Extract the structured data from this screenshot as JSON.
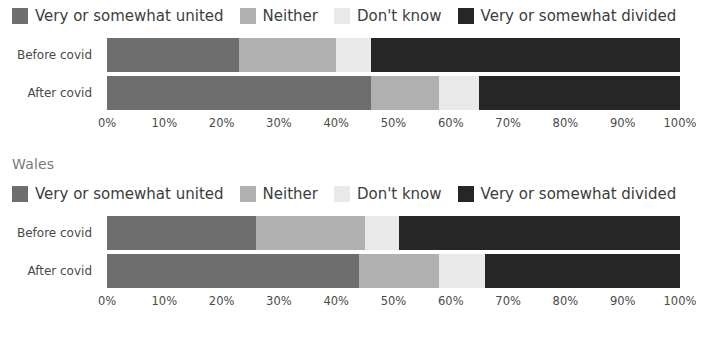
{
  "palette": {
    "united": "#6e6e6e",
    "neither": "#b0b0b0",
    "dont_know": "#e9e9e9",
    "divided": "#262626",
    "text": "#3d3d3d",
    "title_text": "#7a7a7a",
    "background": "#ffffff"
  },
  "legend": {
    "items": [
      {
        "label": "Very or somewhat united",
        "color": "#6e6e6e",
        "key": "united"
      },
      {
        "label": "Neither",
        "color": "#b0b0b0",
        "key": "neither"
      },
      {
        "label": "Don't know",
        "color": "#e9e9e9",
        "key": "dont_know"
      },
      {
        "label": "Very or somewhat divided",
        "color": "#262626",
        "key": "divided"
      }
    ]
  },
  "axis": {
    "ticks": [
      "0%",
      "10%",
      "20%",
      "30%",
      "40%",
      "50%",
      "60%",
      "70%",
      "80%",
      "90%",
      "100%"
    ],
    "min": 0,
    "max": 100
  },
  "sections": [
    {
      "id": "chart-top",
      "title": "",
      "categories": [
        "Before covid",
        "After covid"
      ]
    },
    {
      "id": "chart-wales",
      "title": "Wales",
      "categories": [
        "Before covid",
        "After covid"
      ]
    }
  ],
  "chart_data": [
    {
      "type": "bar",
      "orientation": "horizontal",
      "stacked": true,
      "normalized_percent": true,
      "title": "",
      "xlabel": "",
      "ylabel": "",
      "xlim": [
        0,
        100
      ],
      "grid": false,
      "legend_position": "top",
      "categories": [
        "Before covid",
        "After covid"
      ],
      "series": [
        {
          "name": "Very or somewhat united",
          "color": "#6e6e6e",
          "values": [
            23,
            46
          ]
        },
        {
          "name": "Neither",
          "color": "#b0b0b0",
          "values": [
            17,
            12
          ]
        },
        {
          "name": "Don't know",
          "color": "#e9e9e9",
          "values": [
            6,
            7
          ]
        },
        {
          "name": "Very or somewhat divided",
          "color": "#262626",
          "values": [
            54,
            35
          ]
        }
      ]
    },
    {
      "type": "bar",
      "orientation": "horizontal",
      "stacked": true,
      "normalized_percent": true,
      "title": "Wales",
      "xlabel": "",
      "ylabel": "",
      "xlim": [
        0,
        100
      ],
      "grid": false,
      "legend_position": "top",
      "categories": [
        "Before covid",
        "After covid"
      ],
      "series": [
        {
          "name": "Very or somewhat united",
          "color": "#6e6e6e",
          "values": [
            26,
            44
          ]
        },
        {
          "name": "Neither",
          "color": "#b0b0b0",
          "values": [
            19,
            14
          ]
        },
        {
          "name": "Don't know",
          "color": "#e9e9e9",
          "values": [
            6,
            8
          ]
        },
        {
          "name": "Very or somewhat divided",
          "color": "#262626",
          "values": [
            49,
            34
          ]
        }
      ]
    }
  ]
}
